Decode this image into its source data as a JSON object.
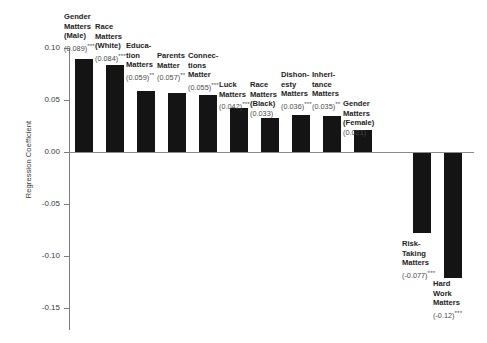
{
  "chart_data": {
    "type": "bar",
    "title": "",
    "xlabel": "",
    "ylabel": "Regression Coefficient",
    "ylim": [
      -0.15,
      0.1
    ],
    "yticks": [
      "0.10",
      "0.05",
      "0.00",
      "-0.05",
      "-0.10",
      "-0.15"
    ],
    "ytick_values": [
      0.1,
      0.05,
      0.0,
      -0.05,
      -0.1,
      -0.15
    ],
    "grid": false,
    "legend": "none",
    "bar_color": "#141414",
    "categories": [
      "Gender Matters (Male)",
      "Race Matters (White)",
      "Education Matters",
      "Parents Matter",
      "Connections Matter",
      "Luck Matters",
      "Race Matters (Black)",
      "Dishonesty Matters",
      "Inheritance Matters",
      "Gender Matters (Female)",
      "Risk-Taking Matters",
      "Hard Work Matters"
    ],
    "values": [
      0.089,
      0.084,
      0.059,
      0.057,
      0.055,
      0.042,
      0.033,
      0.036,
      0.035,
      0.021,
      -0.077,
      -0.12
    ],
    "bars": [
      {
        "label": "Gender\nMatters\n(Male)",
        "value_text": "(0.089)",
        "stars": "***",
        "value": 0.089
      },
      {
        "label": "Race\nMatters\n(White)",
        "value_text": "(0.084)",
        "stars": "***",
        "value": 0.084
      },
      {
        "label": "Educa-\ntion\nMatters",
        "value_text": "(0.059)",
        "stars": "**",
        "value": 0.059
      },
      {
        "label": "Parents\nMatter",
        "value_text": "(0.057)",
        "stars": "**",
        "value": 0.057
      },
      {
        "label": "Connec-\ntions\nMatter",
        "value_text": "(0.055)",
        "stars": "***",
        "value": 0.055
      },
      {
        "label": "Luck\nMatters",
        "value_text": "(0.042)",
        "stars": "***",
        "value": 0.042
      },
      {
        "label": "Race\nMatters\n(Black)",
        "value_text": "(0.033)",
        "stars": "",
        "value": 0.033
      },
      {
        "label": "Dishon-\nesty\nMatters",
        "value_text": "(0.036)",
        "stars": "***",
        "value": 0.036
      },
      {
        "label": "Inheri-\ntance\nMatters",
        "value_text": "(0.035)",
        "stars": "**",
        "value": 0.035
      },
      {
        "label": "Gender\nMatters\n(Female)",
        "value_text": "(0.021)",
        "stars": "",
        "value": 0.021
      },
      {
        "label": "Risk-\nTaking\nMatters",
        "value_text": "(-0.077)",
        "stars": "***",
        "value": -0.077
      },
      {
        "label": "Hard\nWork\nMatters",
        "value_text": "(-0.12)",
        "stars": "***",
        "value": -0.12
      }
    ]
  },
  "layout": {
    "bar_x": [
      75,
      106,
      137,
      168,
      199,
      230,
      261,
      292,
      323,
      354,
      413,
      444
    ],
    "bar_width": 18,
    "label_x": [
      64,
      95,
      126,
      157,
      188,
      219,
      250,
      281,
      312,
      343,
      402,
      433
    ],
    "label_top": [
      12,
      22,
      41,
      51,
      51,
      80,
      80,
      70,
      70,
      99,
      239,
      279
    ],
    "tick_y": [
      48,
      100,
      152,
      204,
      256,
      308
    ],
    "zero_y": 152,
    "px_per_unit": 1040
  }
}
